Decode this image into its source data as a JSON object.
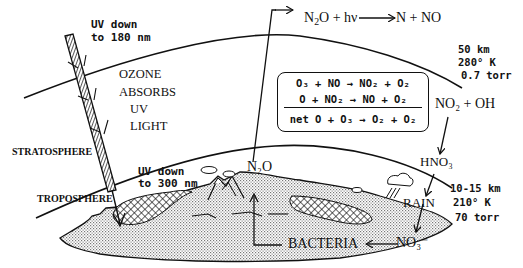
{
  "diagram": {
    "layers": {
      "stratosphere": "STRATOSPHERE",
      "troposphere": "TROPOSPHERE"
    },
    "uv": {
      "top_label_1": "UV down",
      "top_label_2": "to 180 nm",
      "bottom_label_1": "UV down",
      "bottom_label_2": "to 300 nm"
    },
    "ozone_note": [
      "OZONE",
      "ABSORBS",
      "UV",
      "LIGHT"
    ],
    "upper_boundary": {
      "altitude": "50 km",
      "temperature": "280° K",
      "pressure": "0.7 torr"
    },
    "lower_boundary": {
      "altitude": "10-15 km",
      "temperature": "210° K",
      "pressure": "70 torr"
    },
    "reactions": {
      "photolysis": {
        "reactant": "N",
        "reactant_sub": "2",
        "reactant_tail": "O + hν",
        "products": "N + NO"
      },
      "cycle": [
        {
          "lhs": "O₃ + NO",
          "rhs": "NO₂ + O₂"
        },
        {
          "lhs": "O + NO₂",
          "rhs": "NO + O₂"
        }
      ],
      "net_label": "net",
      "net": {
        "lhs": "O + O₃",
        "rhs": "O₂ + O₂"
      },
      "termination": "NO₂ + OH",
      "acid": "HNO₃"
    },
    "surface": {
      "n2o": "N₂O",
      "rain": "RAIN",
      "bacteria": "BACTERIA",
      "nitrate": "NO₃⁻"
    }
  }
}
